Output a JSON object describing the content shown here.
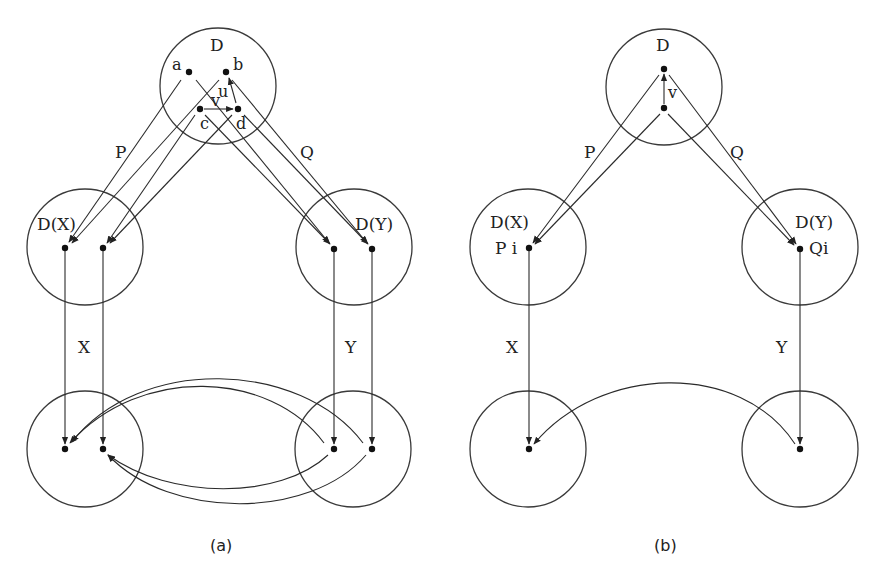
{
  "diagram": {
    "panel_a": {
      "caption": "(a)",
      "circles": {
        "top": {
          "label": "D",
          "cx": 218,
          "cy": 86,
          "r": 58
        },
        "mid_left": {
          "label": "D(X)",
          "cx": 85,
          "cy": 247,
          "r": 58
        },
        "mid_right": {
          "label": "D(Y)",
          "cx": 354,
          "cy": 247,
          "r": 58
        },
        "bot_left": {
          "label": "",
          "cx": 85,
          "cy": 449,
          "r": 58
        },
        "bot_right": {
          "label": "",
          "cx": 353,
          "cy": 449,
          "r": 58
        }
      },
      "point_labels": {
        "a": "a",
        "b": "b",
        "c": "c",
        "d": "d",
        "u": "u",
        "v": "v"
      },
      "edge_labels": {
        "P": "P",
        "Q": "Q",
        "X": "X",
        "Y": "Y"
      }
    },
    "panel_b": {
      "caption": "(b)",
      "circles": {
        "top": {
          "label": "D",
          "cx": 664,
          "cy": 87,
          "r": 58
        },
        "mid_left": {
          "label": "D(X)",
          "cx": 528,
          "cy": 247,
          "r": 58
        },
        "mid_right": {
          "label": "D(Y)",
          "cx": 800,
          "cy": 247,
          "r": 58
        },
        "bot_left": {
          "label": "",
          "cx": 528,
          "cy": 449,
          "r": 58
        },
        "bot_right": {
          "label": "",
          "cx": 800,
          "cy": 449,
          "r": 58
        }
      },
      "point_labels": {
        "v": "v",
        "Pi": "P i",
        "Qi": "Qi"
      },
      "edge_labels": {
        "P": "P",
        "Q": "Q",
        "X": "X",
        "Y": "Y"
      }
    },
    "colors": {
      "stroke": "#2a2a2a",
      "background": "#ffffff"
    }
  }
}
